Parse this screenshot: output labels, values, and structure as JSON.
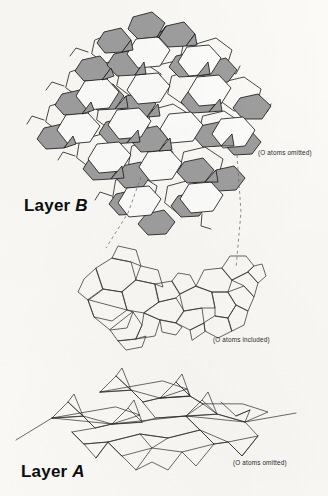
{
  "figure": {
    "kind": "crystal-structure-diagram",
    "background_color": "#fbfaf7",
    "ink_color": "#1a1a1a",
    "polygon_fill_gray": "#9e9e9e",
    "polygon_fill_white": "#fdfdfb"
  },
  "labels": {
    "layer_b": "Layer ",
    "layer_b_italic": "B",
    "layer_a": "Layer ",
    "layer_a_italic": "A",
    "note_layer_b": "(O atoms omitted)",
    "note_middle": "(O atoms included)",
    "note_layer_a": "(O atoms omitted)"
  },
  "panels": [
    {
      "name": "layer-b-sheet",
      "label": "Layer B",
      "note": "(O atoms omitted)",
      "description": "Polyhedral sheet viewed near-normal; alternating gray and white polygons tiling into hexagonal rings",
      "fill_scheme": [
        "gray",
        "white"
      ]
    },
    {
      "name": "middle-detail",
      "label": "",
      "note": "(O atoms included)",
      "description": "Wireframe detail of one polyhedral cluster drawn with O atoms included",
      "fill_scheme": [
        "none"
      ]
    },
    {
      "name": "layer-a-chain",
      "label": "Layer A",
      "note": "(O atoms omitted)",
      "description": "Side/oblique view of corrugated tetrahedral chains forming a zigzag sheet",
      "fill_scheme": [
        "none"
      ]
    }
  ],
  "connectors": [
    {
      "name": "leader-left",
      "style": "dashed",
      "from": "layer-b-sheet",
      "to": "middle-detail"
    },
    {
      "name": "leader-right",
      "style": "dashed",
      "from": "layer-b-sheet",
      "to": "middle-detail"
    }
  ]
}
